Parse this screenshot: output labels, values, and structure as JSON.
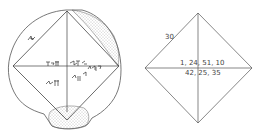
{
  "figure": {
    "left_panel": {
      "description": "Drawing of clay tablet YBC 7289 with inscribed square and diagonals",
      "line_color": "#444444"
    },
    "right_panel": {
      "description": "Transcription diagram of square with diagonals",
      "side_label": "30",
      "diagonal_label": "1, 24, 51, 10",
      "product_label": "42, 25, 35",
      "line_color": "#555555"
    }
  }
}
